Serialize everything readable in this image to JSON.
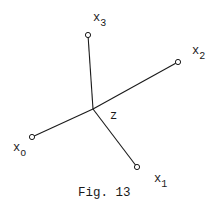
{
  "figure": {
    "caption": "Fig. 13",
    "center": {
      "id": "z",
      "label": "z",
      "x": 93,
      "y": 109
    },
    "nodes": [
      {
        "id": "x0",
        "base": "x",
        "sub": "o",
        "x": 32,
        "y": 137
      },
      {
        "id": "x1",
        "base": "x",
        "sub": "1",
        "x": 137,
        "y": 167
      },
      {
        "id": "x2",
        "base": "x",
        "sub": "2",
        "x": 178,
        "y": 62
      },
      {
        "id": "x3",
        "base": "x",
        "sub": "3",
        "x": 88,
        "y": 35
      }
    ],
    "edges": [
      {
        "from": "z",
        "to": "x0"
      },
      {
        "from": "z",
        "to": "x1"
      },
      {
        "from": "z",
        "to": "x2"
      },
      {
        "from": "z",
        "to": "x3"
      }
    ],
    "colors": {
      "ink": "#1a1a1a",
      "background": "#ffffff"
    }
  }
}
